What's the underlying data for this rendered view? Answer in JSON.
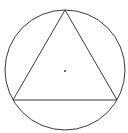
{
  "diagram": {
    "type": "inscribed-equilateral-triangle-in-circle",
    "circle": {
      "cx": 65,
      "cy": 70,
      "r": 60,
      "stroke": "#3a3a3a",
      "stroke_width": 1
    },
    "triangle": {
      "vertices": [
        {
          "x": 65,
          "y": 10
        },
        {
          "x": 13,
          "y": 100
        },
        {
          "x": 117,
          "y": 100
        }
      ],
      "stroke": "#3a3a3a",
      "stroke_width": 1
    },
    "center_point": {
      "x": 65,
      "y": 71,
      "r": 1,
      "fill": "#333333"
    },
    "background": "#ffffff"
  }
}
